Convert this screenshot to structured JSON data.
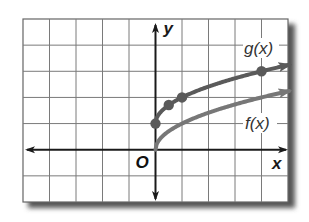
{
  "chart_data": {
    "type": "line",
    "title": "",
    "xlabel": "x",
    "ylabel": "y",
    "origin_label": "O",
    "xlim": [
      -5,
      5
    ],
    "ylim": [
      -2,
      5
    ],
    "grid": true,
    "grid_step": 1,
    "series": [
      {
        "name": "g(x)",
        "label": "g(x)",
        "color": "#5a5a5a",
        "function": "sqrt(x) + 1",
        "x": [
          0,
          0.5,
          1,
          4
        ],
        "y": [
          1,
          1.71,
          2,
          3
        ],
        "marked_points": [
          [
            0,
            1
          ],
          [
            0.5,
            1.71
          ],
          [
            1,
            2
          ],
          [
            4,
            3
          ]
        ],
        "arrow_end": true
      },
      {
        "name": "f(x)",
        "label": "f(x)",
        "color": "#777777",
        "function": "sqrt(x)",
        "x": [
          0,
          1,
          4,
          5
        ],
        "y": [
          0,
          1,
          2,
          2.24
        ],
        "marked_points": [],
        "arrow_end": true
      }
    ],
    "annotations": [
      {
        "text": "g(x)",
        "near": [
          3.6,
          3.6
        ]
      },
      {
        "text": "f(x)",
        "near": [
          3.6,
          1.1
        ]
      }
    ]
  }
}
